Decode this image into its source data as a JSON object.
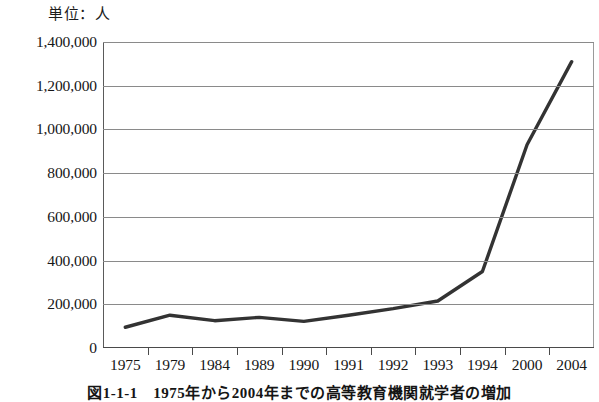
{
  "chart_data": {
    "type": "line",
    "title": "",
    "unit_label": "単位：人",
    "caption": "図1-1-1　1975年から2004年までの高等教育機関就学者の増加",
    "xlabel": "",
    "ylabel": "",
    "categories": [
      "1975",
      "1979",
      "1984",
      "1989",
      "1990",
      "1991",
      "1992",
      "1993",
      "1994",
      "2000",
      "2004"
    ],
    "values": [
      95000,
      150000,
      125000,
      140000,
      122000,
      150000,
      180000,
      215000,
      350000,
      930000,
      1310000
    ],
    "ylim": [
      0,
      1400000
    ],
    "yticks": [
      0,
      200000,
      400000,
      600000,
      800000,
      1000000,
      1200000,
      1400000
    ],
    "ytick_labels": [
      "0",
      "200,000",
      "400,000",
      "600,000",
      "800,000",
      "1,000,000",
      "1,200,000",
      "1,400,000"
    ],
    "grid": true,
    "legend": "none",
    "series_color": "#333333",
    "grid_color": "#8a8a8a",
    "axis_color": "#4a4a4a"
  }
}
